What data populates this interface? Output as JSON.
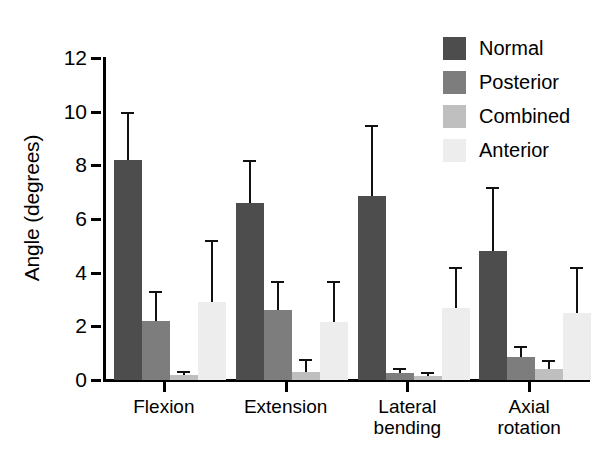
{
  "chart_data": {
    "type": "bar",
    "title": "",
    "subtitle": "",
    "xlabel": "",
    "ylabel": "Angle (degrees)",
    "categories": [
      "Flexion",
      "Extension",
      "Lateral\nbending",
      "Axial\nrotation"
    ],
    "ylim": [
      0,
      12
    ],
    "yticks": [
      0,
      2,
      4,
      6,
      8,
      10,
      12
    ],
    "ytick_labels": [
      "0",
      "2",
      "4",
      "6",
      "8",
      "10",
      "12"
    ],
    "grid": false,
    "legend_position": "top-right",
    "error_bars": "upper-only",
    "series": [
      {
        "name": "Normal",
        "color": "#4d4d4d",
        "values": [
          8.2,
          6.6,
          6.85,
          4.8
        ],
        "errors_upper": [
          10.0,
          8.2,
          9.5,
          7.2
        ]
      },
      {
        "name": "Posterior",
        "color": "#7d7d7d",
        "values": [
          2.2,
          2.6,
          0.25,
          0.85
        ],
        "errors_upper": [
          3.3,
          3.7,
          0.45,
          1.25
        ]
      },
      {
        "name": "Combined",
        "color": "#bfbfbf",
        "values": [
          0.2,
          0.3,
          0.15,
          0.4
        ],
        "errors_upper": [
          0.35,
          0.8,
          0.3,
          0.75
        ]
      },
      {
        "name": "Anterior",
        "color": "#ededed",
        "values": [
          2.9,
          2.15,
          2.7,
          2.5
        ],
        "errors_upper": [
          5.2,
          3.7,
          4.2,
          4.2
        ]
      }
    ]
  },
  "legend": {
    "items": [
      {
        "label": "Normal",
        "color": "#4d4d4d"
      },
      {
        "label": "Posterior",
        "color": "#7d7d7d"
      },
      {
        "label": "Combined",
        "color": "#bfbfbf"
      },
      {
        "label": "Anterior",
        "color": "#ededed"
      }
    ]
  },
  "axes": {
    "y_axis_label": "Angle (degrees)"
  }
}
